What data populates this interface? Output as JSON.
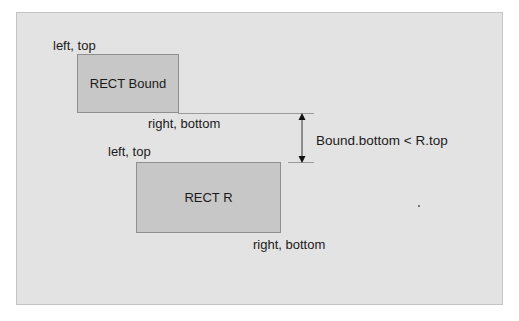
{
  "diagram": {
    "title": "",
    "background_color": "#e3e3e3",
    "rect_fill": "#c7c7c7",
    "rect_border": "#8f8f8f",
    "rects": [
      {
        "id": "bound",
        "label": "RECT Bound",
        "top_left_label": "left, top",
        "bottom_right_label": "right, bottom"
      },
      {
        "id": "r",
        "label": "RECT R",
        "top_left_label": "left, top",
        "bottom_right_label": "right, bottom"
      }
    ],
    "dimension": {
      "label": "Bound.bottom < R.top",
      "icon": "double-headed-vertical-arrow"
    }
  }
}
